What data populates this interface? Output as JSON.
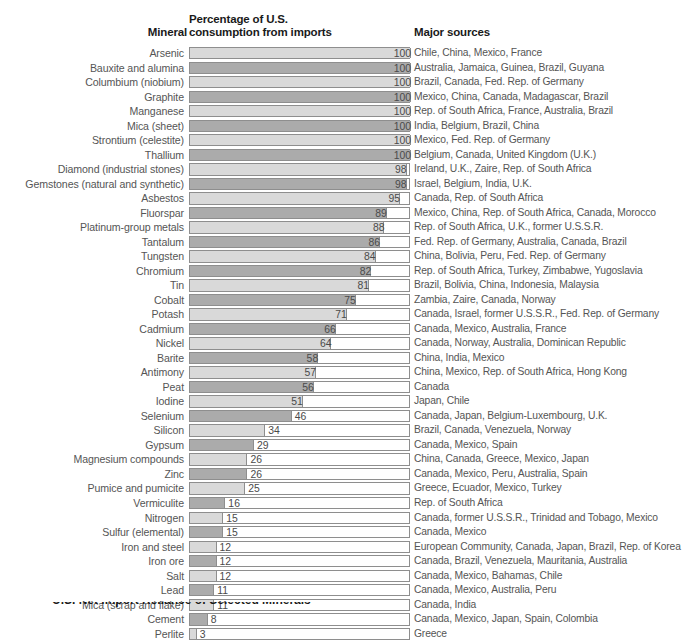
{
  "header": {
    "mineral": "Mineral",
    "percentage_line1": "Percentage of U.S.",
    "percentage_line2": "consumption from imports",
    "sources": "Major sources"
  },
  "caption_partial": "U.S. Net Import Reliance of Selected Minerals",
  "chart_data": {
    "type": "bar",
    "title": "Percentage of U.S. consumption from imports",
    "xlabel": "",
    "ylabel": "Mineral",
    "xlim": [
      0,
      100
    ],
    "grid": false,
    "legend": "none",
    "orientation": "horizontal",
    "categories": [
      "Arsenic",
      "Bauxite and alumina",
      "Columbium (niobium)",
      "Graphite",
      "Manganese",
      "Mica (sheet)",
      "Strontium (celestite)",
      "Thallium",
      "Diamond (industrial stones)",
      "Gemstones (natural and synthetic)",
      "Asbestos",
      "Fluorspar",
      "Platinum-group metals",
      "Tantalum",
      "Tungsten",
      "Chromium",
      "Tin",
      "Cobalt",
      "Potash",
      "Cadmium",
      "Nickel",
      "Barite",
      "Antimony",
      "Peat",
      "Iodine",
      "Selenium",
      "Silicon",
      "Gypsum",
      "Magnesium compounds",
      "Zinc",
      "Pumice and pumicite",
      "Vermiculite",
      "Nitrogen",
      "Sulfur (elemental)",
      "Iron and steel",
      "Iron ore",
      "Salt",
      "Lead",
      "Mica (scrap and flake)",
      "Cement",
      "Perlite"
    ],
    "values": [
      100,
      100,
      100,
      100,
      100,
      100,
      100,
      100,
      98,
      98,
      95,
      89,
      88,
      86,
      84,
      82,
      81,
      75,
      71,
      66,
      64,
      58,
      57,
      56,
      51,
      46,
      34,
      29,
      26,
      26,
      25,
      16,
      15,
      15,
      12,
      12,
      12,
      11,
      11,
      8,
      3
    ],
    "sources": [
      "Chile, China, Mexico, France",
      "Australia, Jamaica, Guinea, Brazil, Guyana",
      "Brazil, Canada, Fed. Rep. of Germany",
      "Mexico, China, Canada, Madagascar, Brazil",
      "Rep. of South Africa, France, Australia, Brazil",
      "India, Belgium, Brazil, China",
      "Mexico,  Fed. Rep. of Germany",
      "Belgium, Canada, United Kingdom (U.K.)",
      "Ireland, U.K., Zaire, Rep. of South Africa",
      "Israel, Belgium, India, U.K.",
      "Canada, Rep. of South Africa",
      "Mexico, China, Rep. of South Africa, Canada, Morocco",
      "Rep. of South Africa, U.K., former U.S.S.R.",
      "Fed. Rep. of Germany, Australia, Canada, Brazil",
      "China, Bolivia, Peru, Fed. Rep. of Germany",
      "Rep. of South Africa, Turkey, Zimbabwe, Yugoslavia",
      "Brazil, Bolivia, China, Indonesia, Malaysia",
      "Zambia, Zaire, Canada, Norway",
      "Canada, Israel, former U.S.S.R., Fed. Rep. of Germany",
      "Canada, Mexico, Australia, France",
      "Canada, Norway, Australia, Dominican Republic",
      "China, India, Mexico",
      "China, Mexico, Rep. of South Africa, Hong Kong",
      "Canada",
      "Japan, Chile",
      "Canada, Japan, Belgium-Luxembourg, U.K.",
      "Brazil, Canada, Venezuela, Norway",
      "Canada, Mexico, Spain",
      "China, Canada, Greece, Mexico, Japan",
      "Canada, Mexico, Peru, Australia, Spain",
      "Greece, Ecuador, Mexico, Turkey",
      "Rep. of South Africa",
      "Canada, former U.S.S.R., Trinidad and Tobago, Mexico",
      "Canada, Mexico",
      "European Community, Canada, Japan, Brazil, Rep. of Korea",
      "Canada, Brazil, Venezuela, Mauritania, Australia",
      "Canada, Mexico, Bahamas, Chile",
      "Canada, Mexico, Australia, Peru",
      "Canada, India",
      "Canada, Mexico, Japan, Spain, Colombia",
      "Greece"
    ],
    "bar_colors": {
      "light": "#d9d9d9",
      "dark": "#ababab",
      "outline": "#8e8e8e",
      "track_background": "#ffffff"
    },
    "label_placement_rule": "values >= 50 rendered inside bar right-aligned; values < 50 rendered outside bar left-aligned"
  }
}
